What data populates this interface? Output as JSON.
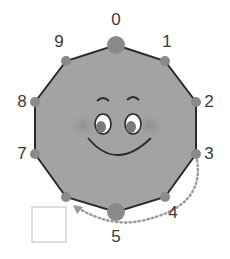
{
  "diagram": {
    "title": "",
    "shape": "decagon",
    "face": "smiley",
    "positions": [
      {
        "label": "0",
        "emphasized": true
      },
      {
        "label": "1",
        "emphasized": false
      },
      {
        "label": "2",
        "emphasized": false
      },
      {
        "label": "3",
        "emphasized": false
      },
      {
        "label": "4",
        "emphasized": false
      },
      {
        "label": "5",
        "emphasized": true
      },
      {
        "label": "6",
        "emphasized": false,
        "hidden_label": true
      },
      {
        "label": "7",
        "emphasized": false
      },
      {
        "label": "8",
        "emphasized": false
      },
      {
        "label": "9",
        "emphasized": false
      }
    ],
    "arrow": {
      "path": [
        "3",
        "4",
        "5",
        "6"
      ],
      "style": "dotted",
      "direction": "clockwise"
    },
    "answer_box": {
      "value": ""
    },
    "colors": {
      "fill": "#a3a3a3",
      "outline": "#2a2a2a",
      "dot": "#8a8a8a",
      "arrow": "#9a9a9a",
      "text": "#3a3a3a",
      "box_border": "#c8c8c8"
    }
  }
}
